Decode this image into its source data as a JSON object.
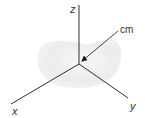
{
  "diagram": {
    "labels": {
      "z": "z",
      "x": "x",
      "y": "y",
      "cm": "cm"
    },
    "colors": {
      "axis": "#1a1a1a",
      "body_fill": "#ececec",
      "body_edge": "#f5f5f5",
      "text": "#333333"
    }
  }
}
